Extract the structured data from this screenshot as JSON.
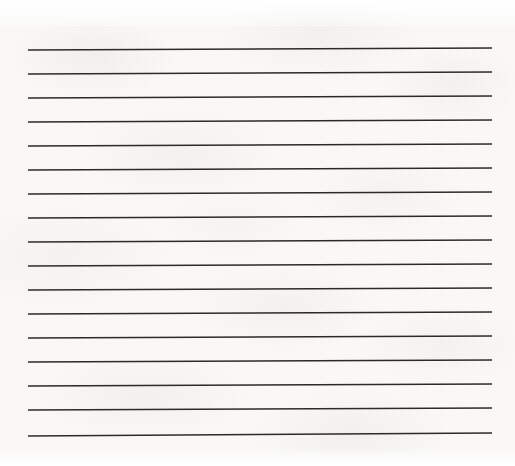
{
  "document": {
    "kind": "scanned-ruled-paper",
    "title": "Blank lined notebook page",
    "page_text": "",
    "written_content": "",
    "colors": {
      "paper": "#faf9f7",
      "rule_line": "#2b2b2b",
      "page_border": "#ffffff"
    }
  },
  "canvas": {
    "width": 515,
    "height": 466
  },
  "ruling": {
    "line_count": 17,
    "left_x": 28,
    "right_x": 492,
    "spacing_px": 24,
    "first_line_y": 49,
    "tilt_px": 2,
    "stroke_width": 1.5,
    "lines": [
      {
        "index": 1,
        "y_left": 50.0,
        "y_right": 48.0
      },
      {
        "index": 2,
        "y_left": 74.0,
        "y_right": 72.0
      },
      {
        "index": 3,
        "y_left": 98.0,
        "y_right": 96.0
      },
      {
        "index": 4,
        "y_left": 122.0,
        "y_right": 120.0
      },
      {
        "index": 5,
        "y_left": 146.0,
        "y_right": 144.0
      },
      {
        "index": 6,
        "y_left": 170.0,
        "y_right": 168.0
      },
      {
        "index": 7,
        "y_left": 194.0,
        "y_right": 192.0
      },
      {
        "index": 8,
        "y_left": 218.0,
        "y_right": 216.0
      },
      {
        "index": 9,
        "y_left": 242.0,
        "y_right": 240.0
      },
      {
        "index": 10,
        "y_left": 266.0,
        "y_right": 264.0
      },
      {
        "index": 11,
        "y_left": 290.0,
        "y_right": 288.0
      },
      {
        "index": 12,
        "y_left": 314.0,
        "y_right": 312.0
      },
      {
        "index": 13,
        "y_left": 338.0,
        "y_right": 336.0
      },
      {
        "index": 14,
        "y_left": 362.0,
        "y_right": 360.0
      },
      {
        "index": 15,
        "y_left": 386.0,
        "y_right": 384.0
      },
      {
        "index": 16,
        "y_left": 410.0,
        "y_right": 408.0
      },
      {
        "index": 17,
        "y_left": 436.0,
        "y_right": 433.0
      }
    ]
  },
  "margins": {
    "top_px": 26,
    "bottom_px": 16,
    "left_px": 28,
    "right_px": 23
  }
}
